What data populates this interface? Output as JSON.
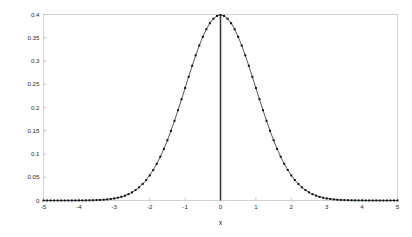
{
  "figure": {
    "background_color": "#ffffff",
    "axis_color": "#cfcfcf",
    "curve_color": "#3a3a3a",
    "marker_color": "#111111",
    "vline_color": "#333333"
  },
  "chart_data": {
    "type": "line",
    "title": "",
    "subtitle": "",
    "xlabel": "x",
    "ylabel": "",
    "xlim": [
      -5,
      5
    ],
    "ylim": [
      0,
      0.4
    ],
    "grid": false,
    "legend": null,
    "legend_position": "none",
    "marker": "square",
    "line_style": "solid",
    "xticks": [
      -5,
      -4,
      -3,
      -2,
      -1,
      0,
      1,
      2,
      3,
      4,
      5
    ],
    "xticklabels": [
      "-5",
      "-4",
      "-3",
      "-2",
      "-1",
      "0",
      "1",
      "2",
      "3",
      "4",
      "5"
    ],
    "yticks": [
      0,
      0.05,
      0.1,
      0.15,
      0.2,
      0.25,
      0.3,
      0.35,
      0.4
    ],
    "yticklabels": [
      "0",
      "0.05",
      "0.1",
      "0.15",
      "0.2",
      "0.25",
      "0.3",
      "0.35",
      "0.4"
    ],
    "annotations": [
      {
        "name": "vertical-line-at-mean",
        "type": "vline",
        "x": 0,
        "y_from": 0,
        "y_to": 0.39894
      }
    ],
    "series": [
      {
        "name": "standard normal pdf",
        "x": [
          -5,
          -4.9,
          -4.8,
          -4.7,
          -4.6,
          -4.5,
          -4.4,
          -4.3,
          -4.2,
          -4.1,
          -4,
          -3.9,
          -3.8,
          -3.7,
          -3.6,
          -3.5,
          -3.4,
          -3.3,
          -3.2,
          -3.1,
          -3,
          -2.9,
          -2.8,
          -2.7,
          -2.6,
          -2.5,
          -2.4,
          -2.3,
          -2.2,
          -2.1,
          -2,
          -1.9,
          -1.8,
          -1.7,
          -1.6,
          -1.5,
          -1.4,
          -1.3,
          -1.2,
          -1.1,
          -1,
          -0.9,
          -0.8,
          -0.7,
          -0.6,
          -0.5,
          -0.4,
          -0.3,
          -0.2,
          -0.1,
          0,
          0.1,
          0.2,
          0.3,
          0.4,
          0.5,
          0.6,
          0.7,
          0.8,
          0.9,
          1,
          1.1,
          1.2,
          1.3,
          1.4,
          1.5,
          1.6,
          1.7,
          1.8,
          1.9,
          2,
          2.1,
          2.2,
          2.3,
          2.4,
          2.5,
          2.6,
          2.7,
          2.8,
          2.9,
          3,
          3.1,
          3.2,
          3.3,
          3.4,
          3.5,
          3.6,
          3.7,
          3.8,
          3.9,
          4,
          4.1,
          4.2,
          4.3,
          4.4,
          4.5,
          4.6,
          4.7,
          4.8,
          4.9,
          5
        ],
        "y": [
          1.5e-06,
          2.5e-06,
          4e-06,
          6.3e-06,
          9.8e-06,
          1.6e-05,
          2.49e-05,
          3.87e-05,
          5.89e-05,
          8.93e-05,
          0.0001338,
          0.0001987,
          0.0002919,
          0.0004248,
          0.0006119,
          0.0008727,
          0.0012322,
          0.0017226,
          0.0023841,
          0.0032668,
          0.0044318,
          0.0059525,
          0.0079155,
          0.0104209,
          0.013583,
          0.0175283,
          0.0223945,
          0.028327,
          0.0354746,
          0.0439836,
          0.053991,
          0.0656158,
          0.0789502,
          0.0940491,
          0.1109208,
          0.1295176,
          0.1497275,
          0.1713686,
          0.1941861,
          0.2178522,
          0.2419707,
          0.2660852,
          0.2896916,
          0.3122539,
          0.3332246,
          0.3520653,
          0.3682701,
          0.3813878,
          0.3910427,
          0.3969525,
          0.3989423,
          0.3969525,
          0.3910427,
          0.3813878,
          0.3682701,
          0.3520653,
          0.3332246,
          0.3122539,
          0.2896916,
          0.2660852,
          0.2419707,
          0.2178522,
          0.1941861,
          0.1713686,
          0.1497275,
          0.1295176,
          0.1109208,
          0.0940491,
          0.0789502,
          0.0656158,
          0.053991,
          0.0439836,
          0.0354746,
          0.028327,
          0.0223945,
          0.0175283,
          0.013583,
          0.0104209,
          0.0079155,
          0.0059525,
          0.0044318,
          0.0032668,
          0.0023841,
          0.0017226,
          0.0012322,
          0.0008727,
          0.0006119,
          0.0004248,
          0.0002919,
          0.0001987,
          0.0001338,
          8.93e-05,
          5.89e-05,
          3.87e-05,
          2.49e-05,
          1.6e-05,
          9.8e-06,
          6.3e-06,
          4e-06,
          2.5e-06,
          1.5e-06
        ]
      }
    ]
  }
}
